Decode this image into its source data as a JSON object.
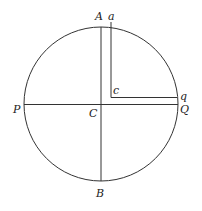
{
  "diagram": {
    "type": "geometric-figure",
    "colors": {
      "stroke": "#333333",
      "background": "#ffffff"
    },
    "circle": {
      "center_label": "C",
      "cx": 101,
      "cy": 104,
      "r": 77
    },
    "labels": {
      "A": "A",
      "a": "a",
      "B": "B",
      "P": "P",
      "Q": "Q",
      "q": "q",
      "C": "C",
      "c": "c"
    },
    "lines": [
      {
        "name": "diameter-AB",
        "from": "A",
        "to": "B"
      },
      {
        "name": "diameter-PQ",
        "from": "P",
        "to": "Q"
      },
      {
        "name": "segment-ac",
        "from": "a",
        "to": "c"
      },
      {
        "name": "segment-cq",
        "from": "c",
        "to": "q"
      }
    ]
  }
}
